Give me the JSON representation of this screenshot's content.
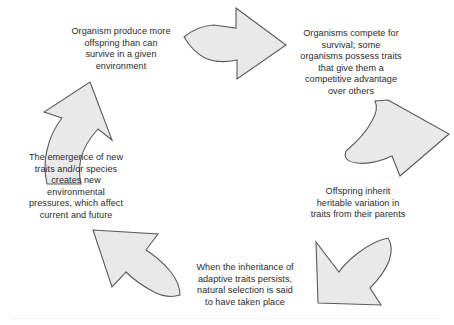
{
  "diagram": {
    "type": "cycle",
    "colors": {
      "arrow_fill": "#e9e9e9",
      "arrow_stroke": "#5a5a5a",
      "text": "#2b2b2b",
      "background": "#ffffff"
    },
    "steps": [
      {
        "id": "overproduction",
        "order": 1,
        "text": "Organism produce more\noffspring than can\nsurvive in a given\nenvironment",
        "arrow_to": "competition",
        "arrow_direction": "right"
      },
      {
        "id": "competition",
        "order": 2,
        "text": "Organisms compete for\nsurvival; some\norganisms possess traits\nthat give them a\ncompetitive advantage\nover others",
        "arrow_to": "inheritance",
        "arrow_direction": "down-left"
      },
      {
        "id": "inheritance",
        "order": 3,
        "text": "Offspring inherit\nheritable variation in\ntraits from their parents",
        "arrow_to": "selection",
        "arrow_direction": "down-left"
      },
      {
        "id": "selection",
        "order": 4,
        "text": "When the inheritance of\nadaptive traits persists,\nnatural selection is said\nto have taken place",
        "arrow_to": "emergence",
        "arrow_direction": "up-left"
      },
      {
        "id": "emergence",
        "order": 5,
        "text": "The emergence of new\ntraits and/or species\ncreates new\nenvironmental\npressures, which affect\ncurrent and future",
        "arrow_to": "overproduction",
        "arrow_direction": "up-right"
      }
    ],
    "arrows": [
      {
        "id": "arrow-top",
        "name": "arrow-right-curved",
        "from": "overproduction",
        "to": "competition"
      },
      {
        "id": "arrow-right",
        "name": "arrow-down-curved",
        "from": "competition",
        "to": "inheritance"
      },
      {
        "id": "arrow-bottom-right",
        "name": "arrow-down-left-curved",
        "from": "inheritance",
        "to": "selection"
      },
      {
        "id": "arrow-bottom-left",
        "name": "arrow-up-left-curved",
        "from": "selection",
        "to": "emergence"
      },
      {
        "id": "arrow-left",
        "name": "arrow-up-right-curved",
        "from": "emergence",
        "to": "overproduction"
      }
    ]
  }
}
